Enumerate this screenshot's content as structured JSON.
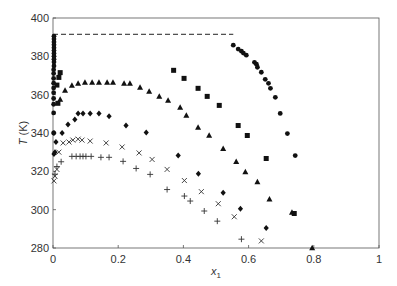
{
  "chart_data": {
    "type": "scatter",
    "title": "",
    "xlabel": "x",
    "xlabel_subscript": "1",
    "ylabel": "T (K)",
    "xlim": [
      0,
      1
    ],
    "ylim": [
      280,
      400
    ],
    "xticks": [
      0,
      0.2,
      0.4,
      0.6,
      0.8,
      1
    ],
    "xtick_labels": [
      "0",
      "0.2",
      "0.4",
      "0.6",
      "0.8",
      "1"
    ],
    "yticks": [
      280,
      300,
      320,
      340,
      360,
      380,
      400
    ],
    "ytick_labels": [
      "280",
      "300",
      "320",
      "340",
      "360",
      "380",
      "400"
    ],
    "grid": false,
    "legend": null,
    "reference_lines": [
      {
        "style": "dashed",
        "x": [
          0,
          0.553
        ],
        "y": [
          391.5,
          391.5
        ]
      }
    ],
    "series": [
      {
        "name": "circles",
        "marker": "circle",
        "points": [
          [
            0.003,
            390.5
          ],
          [
            0.003,
            389.0
          ],
          [
            0.003,
            387.5
          ],
          [
            0.003,
            386.0
          ],
          [
            0.003,
            384.5
          ],
          [
            0.003,
            383.0
          ],
          [
            0.003,
            381.5
          ],
          [
            0.003,
            380.0
          ],
          [
            0.003,
            378.5
          ],
          [
            0.003,
            377.0
          ],
          [
            0.003,
            375.0
          ],
          [
            0.002,
            373.0
          ],
          [
            0.002,
            371.0
          ],
          [
            0.002,
            368.5
          ],
          [
            0.002,
            366.0
          ],
          [
            0.002,
            363.5
          ],
          [
            0.002,
            361.0
          ],
          [
            0.002,
            358.0
          ],
          [
            0.002,
            355.0
          ],
          [
            0.002,
            350.5
          ],
          [
            0.002,
            340.0
          ],
          [
            0.553,
            385.8
          ],
          [
            0.568,
            383.8
          ],
          [
            0.578,
            382.7
          ],
          [
            0.584,
            381.7
          ],
          [
            0.593,
            380.6
          ],
          [
            0.618,
            376.9
          ],
          [
            0.624,
            375.9
          ],
          [
            0.627,
            374.3
          ],
          [
            0.639,
            371.7
          ],
          [
            0.651,
            368.0
          ],
          [
            0.661,
            365.9
          ],
          [
            0.667,
            363.3
          ],
          [
            0.682,
            358.6
          ],
          [
            0.697,
            350.2
          ],
          [
            0.719,
            339.7
          ],
          [
            0.743,
            328.2
          ]
        ]
      },
      {
        "name": "squares",
        "marker": "square",
        "points": [
          [
            0.015,
            355.5
          ],
          [
            0.012,
            365.0
          ],
          [
            0.018,
            369.0
          ],
          [
            0.022,
            371.5
          ],
          [
            0.37,
            372.7
          ],
          [
            0.402,
            368.5
          ],
          [
            0.445,
            363.3
          ],
          [
            0.473,
            359.1
          ],
          [
            0.51,
            354.4
          ],
          [
            0.568,
            343.9
          ],
          [
            0.596,
            338.7
          ],
          [
            0.654,
            326.7
          ],
          [
            0.74,
            298.0
          ]
        ]
      },
      {
        "name": "triangles",
        "marker": "triangle",
        "points": [
          [
            0.022,
            357.5
          ],
          [
            0.037,
            362.2
          ],
          [
            0.058,
            364.8
          ],
          [
            0.077,
            365.8
          ],
          [
            0.098,
            366.4
          ],
          [
            0.12,
            366.4
          ],
          [
            0.141,
            366.4
          ],
          [
            0.166,
            366.4
          ],
          [
            0.184,
            366.4
          ],
          [
            0.218,
            365.8
          ],
          [
            0.236,
            365.8
          ],
          [
            0.267,
            363.8
          ],
          [
            0.295,
            361.7
          ],
          [
            0.326,
            359.1
          ],
          [
            0.353,
            357.0
          ],
          [
            0.39,
            353.3
          ],
          [
            0.409,
            349.2
          ],
          [
            0.445,
            342.9
          ],
          [
            0.479,
            338.7
          ],
          [
            0.522,
            331.8
          ],
          [
            0.562,
            325.0
          ],
          [
            0.59,
            319.7
          ],
          [
            0.627,
            314.4
          ],
          [
            0.664,
            305.5
          ],
          [
            0.733,
            298.5
          ],
          [
            0.795,
            280.0
          ]
        ]
      },
      {
        "name": "diamonds",
        "marker": "diamond",
        "points": [
          [
            0.003,
            329.0
          ],
          [
            0.006,
            330.0
          ],
          [
            0.003,
            340.0
          ],
          [
            0.009,
            335.3
          ],
          [
            0.028,
            340.0
          ],
          [
            0.046,
            344.4
          ],
          [
            0.067,
            347.0
          ],
          [
            0.077,
            350.2
          ],
          [
            0.092,
            350.2
          ],
          [
            0.114,
            350.2
          ],
          [
            0.141,
            350.2
          ],
          [
            0.172,
            348.7
          ],
          [
            0.224,
            343.9
          ],
          [
            0.286,
            340.3
          ],
          [
            0.384,
            328.2
          ],
          [
            0.446,
            318.7
          ],
          [
            0.522,
            308.8
          ],
          [
            0.575,
            300.5
          ],
          [
            0.654,
            290.5
          ]
        ]
      },
      {
        "name": "crosses",
        "marker": "x",
        "points": [
          [
            0.003,
            315.0
          ],
          [
            0.006,
            317.5
          ],
          [
            0.012,
            321.0
          ],
          [
            0.018,
            330.0
          ],
          [
            0.031,
            334.8
          ],
          [
            0.049,
            335.3
          ],
          [
            0.061,
            336.3
          ],
          [
            0.077,
            336.8
          ],
          [
            0.089,
            336.3
          ],
          [
            0.114,
            335.8
          ],
          [
            0.163,
            334.8
          ],
          [
            0.212,
            332.7
          ],
          [
            0.264,
            329.6
          ],
          [
            0.304,
            326.2
          ],
          [
            0.35,
            321.0
          ],
          [
            0.403,
            315.2
          ],
          [
            0.455,
            309.4
          ],
          [
            0.507,
            303.1
          ],
          [
            0.556,
            296.3
          ],
          [
            0.639,
            283.7
          ]
        ]
      },
      {
        "name": "plus",
        "marker": "plus",
        "points": [
          [
            0.006,
            318.5
          ],
          [
            0.012,
            322.5
          ],
          [
            0.025,
            325.0
          ],
          [
            0.058,
            327.8
          ],
          [
            0.071,
            327.8
          ],
          [
            0.083,
            327.8
          ],
          [
            0.092,
            327.8
          ],
          [
            0.101,
            327.8
          ],
          [
            0.117,
            327.8
          ],
          [
            0.147,
            327.3
          ],
          [
            0.172,
            327.3
          ],
          [
            0.215,
            325.2
          ],
          [
            0.255,
            321.5
          ],
          [
            0.298,
            318.4
          ],
          [
            0.35,
            310.5
          ],
          [
            0.403,
            307.1
          ],
          [
            0.421,
            304.5
          ],
          [
            0.464,
            299.3
          ],
          [
            0.504,
            294.0
          ],
          [
            0.578,
            284.6
          ]
        ]
      }
    ]
  }
}
